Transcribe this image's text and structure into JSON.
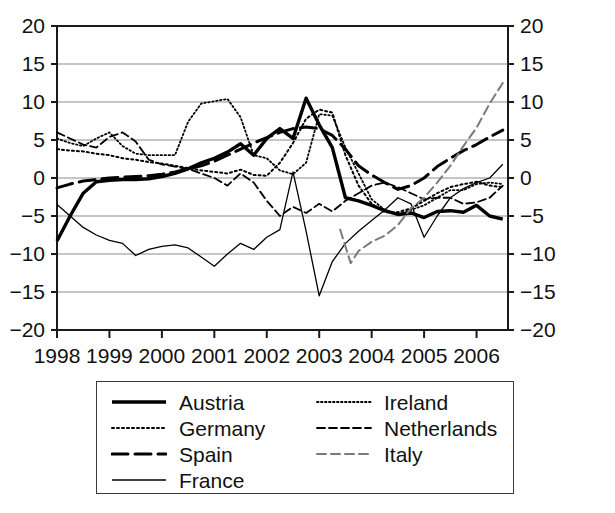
{
  "chart_data": {
    "type": "line",
    "title": "",
    "subtitle": "",
    "xlabel": "",
    "ylabel": "",
    "xlim": [
      1998,
      2006.6
    ],
    "ylim": [
      -20,
      20
    ],
    "ytick_values": [
      -20,
      -15,
      -10,
      -5,
      0,
      5,
      10,
      15,
      20
    ],
    "ytick_labels": [
      "−20",
      "−15",
      "−10",
      "−5",
      "0",
      "5",
      "10",
      "15",
      "20"
    ],
    "xtick_values": [
      1998,
      1999,
      2000,
      2001,
      2002,
      2003,
      2004,
      2005,
      2006
    ],
    "xtick_labels": [
      "1998",
      "1999",
      "2000",
      "2001",
      "2002",
      "2003",
      "2004",
      "2005",
      "2006"
    ],
    "grid": "horizontal",
    "dual_y_axis": true,
    "legend_position": "below",
    "series": [
      {
        "name": "Austria",
        "style": "solid-thick",
        "color": "#000000",
        "width": 3.4,
        "dash": "",
        "x": [
          1998.0,
          1998.25,
          1998.5,
          1998.75,
          1999.0,
          1999.25,
          1999.5,
          1999.75,
          2000.0,
          2000.25,
          2000.5,
          2000.75,
          2001.0,
          2001.25,
          2001.5,
          2001.75,
          2002.0,
          2002.25,
          2002.5,
          2002.75,
          2003.0,
          2003.25,
          2003.5,
          2003.75,
          2004.0,
          2004.25,
          2004.5,
          2004.75,
          2005.0,
          2005.25,
          2005.5,
          2005.75,
          2006.0,
          2006.25,
          2006.5
        ],
        "y": [
          -8.3,
          -5.0,
          -2.0,
          -0.5,
          -0.3,
          -0.2,
          -0.2,
          -0.1,
          0.2,
          0.6,
          1.2,
          2.0,
          2.6,
          3.4,
          4.5,
          3.0,
          5.2,
          6.5,
          5.2,
          10.5,
          7.0,
          4.0,
          -2.6,
          -3.0,
          -3.6,
          -4.3,
          -4.8,
          -4.6,
          -5.2,
          -4.4,
          -4.3,
          -4.5,
          -3.6,
          -5.0,
          -5.4
        ]
      },
      {
        "name": "Germany",
        "style": "dotted",
        "color": "#000000",
        "width": 2.0,
        "dash": "2,3",
        "x": [
          1998.0,
          1998.25,
          1998.5,
          1998.75,
          1999.0,
          1999.25,
          1999.5,
          1999.75,
          2000.0,
          2000.25,
          2000.5,
          2000.75,
          2001.0,
          2001.25,
          2001.5,
          2001.75,
          2002.0,
          2002.25,
          2002.5,
          2002.75,
          2003.0,
          2003.25,
          2003.5,
          2003.75,
          2004.0,
          2004.25,
          2004.5,
          2004.75,
          2005.0,
          2005.25,
          2005.5,
          2005.75,
          2006.0,
          2006.25,
          2006.5
        ],
        "y": [
          3.8,
          3.6,
          3.5,
          3.2,
          3.0,
          2.6,
          2.4,
          2.1,
          1.9,
          1.6,
          1.3,
          1.0,
          0.8,
          0.6,
          1.1,
          0.4,
          0.3,
          2.0,
          4.6,
          7.8,
          9.0,
          8.6,
          3.0,
          -1.0,
          -3.4,
          -4.5,
          -4.5,
          -4.0,
          -3.0,
          -2.0,
          -1.2,
          -0.8,
          -0.5,
          -1.0,
          -1.2
        ]
      },
      {
        "name": "Spain",
        "style": "dashed-long",
        "color": "#000000",
        "width": 3.0,
        "dash": "16,7",
        "x": [
          1998.0,
          1998.25,
          1998.5,
          1998.75,
          1999.0,
          1999.25,
          1999.5,
          1999.75,
          2000.0,
          2000.25,
          2000.5,
          2000.75,
          2001.0,
          2001.25,
          2001.5,
          2001.75,
          2002.0,
          2002.25,
          2002.5,
          2002.75,
          2003.0,
          2003.25,
          2003.5,
          2003.75,
          2004.0,
          2004.25,
          2004.5,
          2004.75,
          2005.0,
          2005.25,
          2005.5,
          2005.75,
          2006.0,
          2006.25,
          2006.5
        ],
        "y": [
          -1.3,
          -0.8,
          -0.4,
          -0.2,
          0.0,
          0.1,
          0.2,
          0.3,
          0.5,
          0.8,
          1.2,
          1.6,
          2.2,
          3.0,
          3.8,
          4.6,
          5.3,
          6.0,
          6.5,
          6.7,
          6.5,
          5.6,
          3.8,
          1.6,
          0.4,
          -0.6,
          -1.5,
          -1.0,
          0.0,
          1.5,
          2.6,
          3.6,
          4.4,
          5.4,
          6.3
        ]
      },
      {
        "name": "France",
        "style": "solid-thin",
        "color": "#000000",
        "width": 1.3,
        "dash": "",
        "x": [
          1998.0,
          1998.25,
          1998.5,
          1998.75,
          1999.0,
          1999.25,
          1999.5,
          1999.75,
          2000.0,
          2000.25,
          2000.5,
          2000.75,
          2001.0,
          2001.25,
          2001.5,
          2001.75,
          2002.0,
          2002.25,
          2002.5,
          2002.75,
          2003.0,
          2003.25,
          2003.5,
          2003.75,
          2004.0,
          2004.25,
          2004.5,
          2004.75,
          2005.0,
          2005.25,
          2005.5,
          2005.75,
          2006.0,
          2006.25,
          2006.5
        ],
        "y": [
          -3.5,
          -5.0,
          -6.5,
          -7.5,
          -8.2,
          -8.6,
          -10.2,
          -9.4,
          -9.0,
          -8.8,
          -9.2,
          -10.4,
          -11.6,
          -10.0,
          -8.6,
          -9.4,
          -7.8,
          -6.8,
          0.8,
          -7.0,
          -15.5,
          -11.0,
          -8.6,
          -7.0,
          -5.6,
          -4.2,
          -2.6,
          -3.4,
          -7.8,
          -5.0,
          -2.6,
          -1.4,
          -0.6,
          0.0,
          1.8
        ]
      },
      {
        "name": "Ireland",
        "style": "dotted-fine",
        "color": "#000000",
        "width": 1.8,
        "dash": "1.5,2.5",
        "x": [
          1998.0,
          1998.25,
          1998.5,
          1998.75,
          1999.0,
          1999.25,
          1999.5,
          1999.75,
          2000.0,
          2000.25,
          2000.5,
          2000.75,
          2001.0,
          2001.25,
          2001.5,
          2001.75,
          2002.0,
          2002.25,
          2002.5,
          2002.75,
          2003.0,
          2003.25,
          2003.5,
          2003.75,
          2004.0,
          2004.25,
          2004.5,
          2004.75,
          2005.0,
          2005.25,
          2005.5,
          2005.75,
          2006.0,
          2006.25,
          2006.5
        ],
        "y": [
          5.2,
          4.6,
          4.2,
          5.2,
          6.0,
          4.2,
          3.2,
          3.0,
          3.0,
          3.0,
          7.4,
          9.8,
          10.1,
          10.4,
          8.0,
          3.0,
          2.6,
          1.0,
          0.5,
          2.0,
          8.4,
          8.2,
          4.0,
          0.6,
          -2.8,
          -4.2,
          -4.8,
          -4.2,
          -3.6,
          -2.6,
          -1.6,
          -1.6,
          -0.8,
          -0.6,
          -0.8
        ]
      },
      {
        "name": "Netherlands",
        "style": "dashed-medium",
        "color": "#000000",
        "width": 1.8,
        "dash": "8,4",
        "x": [
          1998.0,
          1998.25,
          1998.5,
          1998.75,
          1999.0,
          1999.25,
          1999.5,
          1999.75,
          2000.0,
          2000.25,
          2000.5,
          2000.75,
          2001.0,
          2001.25,
          2001.5,
          2001.75,
          2002.0,
          2002.25,
          2002.5,
          2002.75,
          2003.0,
          2003.25,
          2003.5,
          2003.75,
          2004.0,
          2004.25,
          2004.5,
          2004.75,
          2005.0,
          2005.25,
          2005.5,
          2005.75,
          2006.0,
          2006.25,
          2006.5
        ],
        "y": [
          6.0,
          5.2,
          4.4,
          4.0,
          5.4,
          6.0,
          4.8,
          2.4,
          1.8,
          1.5,
          1.2,
          0.6,
          0.0,
          -1.0,
          0.6,
          -0.6,
          -3.0,
          -5.0,
          -3.8,
          -4.6,
          -3.4,
          -4.4,
          -3.0,
          -2.0,
          -1.0,
          -0.6,
          -1.2,
          -2.0,
          -2.8,
          -2.6,
          -2.6,
          -3.4,
          -3.2,
          -2.6,
          -1.0
        ]
      },
      {
        "name": "Italy",
        "style": "dashed-gray",
        "color": "#7a7a7a",
        "width": 2.0,
        "dash": "9,5",
        "x": [
          2003.4,
          2003.6,
          2003.75,
          2004.0,
          2004.25,
          2004.5,
          2004.75,
          2005.0,
          2005.25,
          2005.5,
          2005.75,
          2006.0,
          2006.25,
          2006.5
        ],
        "y": [
          -6.8,
          -11.2,
          -9.6,
          -8.4,
          -7.6,
          -6.2,
          -4.0,
          -2.6,
          -0.6,
          1.6,
          4.2,
          6.6,
          9.8,
          12.5
        ]
      }
    ]
  },
  "legend": {
    "entries": [
      {
        "label": "Austria",
        "series": "Austria"
      },
      {
        "label": "Ireland",
        "series": "Ireland"
      },
      {
        "label": "Germany",
        "series": "Germany"
      },
      {
        "label": "Netherlands",
        "series": "Netherlands"
      },
      {
        "label": "Spain",
        "series": "Spain"
      },
      {
        "label": "Italy",
        "series": "Italy"
      },
      {
        "label": "France",
        "series": "France"
      }
    ]
  },
  "colors": {
    "axis": "#1a1a1a",
    "grid": "#8c8c8c",
    "text": "#111111",
    "italy": "#7a7a7a"
  }
}
